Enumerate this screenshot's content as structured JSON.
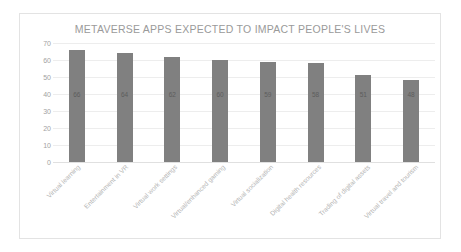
{
  "chart_data": {
    "type": "bar",
    "title": "METAVERSE APPS EXPECTED TO IMPACT PEOPLE'S LIVES",
    "xlabel": "",
    "ylabel": "",
    "ylim": [
      0,
      70
    ],
    "yticks": [
      70,
      60,
      50,
      40,
      30,
      20,
      10,
      0
    ],
    "grid": true,
    "legend": false,
    "bar_color": "#808080",
    "categories": [
      "Virtual learning",
      "Entertainment in VR",
      "Virtual work settings",
      "Virtual/enhanced gaming",
      "Virtual socialization",
      "Digital health resources",
      "Trading of digital assets",
      "Virtual travel and tourism"
    ],
    "values": [
      66,
      64,
      62,
      60,
      59,
      58,
      51,
      48
    ],
    "data_labels": [
      "66",
      "64",
      "62",
      "60",
      "59",
      "58",
      "51",
      "48"
    ]
  }
}
